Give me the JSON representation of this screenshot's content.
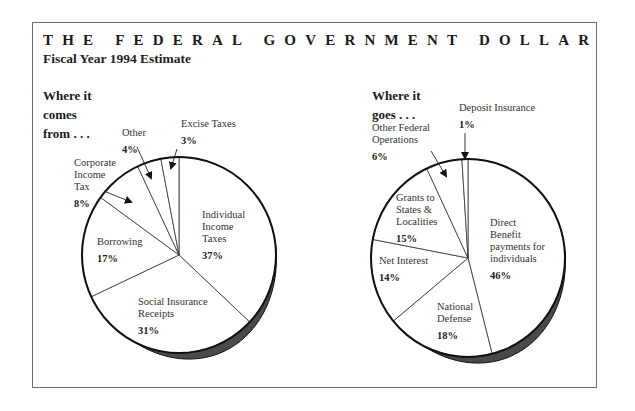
{
  "header": {
    "title": "THE FEDERAL GOVERNMENT DOLLAR",
    "subtitle": "Fiscal Year 1994 Estimate"
  },
  "chart_data": [
    {
      "type": "pie",
      "title": "Where it comes from . . .",
      "title_lines": [
        "Where it",
        "comes",
        "from . . ."
      ],
      "start": "top",
      "direction": "clockwise",
      "slices": [
        {
          "label": "Individual Income Taxes",
          "label_lines": [
            "Individual",
            "Income",
            "Taxes"
          ],
          "value": 37,
          "pct_text": "37%"
        },
        {
          "label": "Social Insurance Receipts",
          "label_lines": [
            "Social Insurance",
            "Receipts"
          ],
          "value": 31,
          "pct_text": "31%"
        },
        {
          "label": "Borrowing",
          "label_lines": [
            "Borrowing"
          ],
          "value": 17,
          "pct_text": "17%"
        },
        {
          "label": "Corporate Income Tax",
          "label_lines": [
            "Corporate",
            "Income",
            "Tax"
          ],
          "value": 8,
          "pct_text": "8%",
          "callout": true
        },
        {
          "label": "Other",
          "label_lines": [
            "Other"
          ],
          "value": 4,
          "pct_text": "4%",
          "callout": true
        },
        {
          "label": "Excise Taxes",
          "label_lines": [
            "Excise Taxes"
          ],
          "value": 3,
          "pct_text": "3%",
          "callout": true
        }
      ]
    },
    {
      "type": "pie",
      "title": "Where it goes . . .",
      "title_lines": [
        "Where it",
        "goes . . ."
      ],
      "start": "top",
      "direction": "clockwise",
      "slices": [
        {
          "label": "Direct Benefit payments for individuals",
          "label_lines": [
            "Direct",
            "Benefit",
            "payments for",
            "individuals"
          ],
          "value": 46,
          "pct_text": "46%"
        },
        {
          "label": "National Defense",
          "label_lines": [
            "National",
            "Defense"
          ],
          "value": 18,
          "pct_text": "18%"
        },
        {
          "label": "Net Interest",
          "label_lines": [
            "Net Interest"
          ],
          "value": 14,
          "pct_text": "14%"
        },
        {
          "label": "Grants to States & Localities",
          "label_lines": [
            "Grants to",
            "States &",
            "Localities"
          ],
          "value": 15,
          "pct_text": "15%"
        },
        {
          "label": "Other Federal Operations",
          "label_lines": [
            "Other Federal",
            "Operations"
          ],
          "value": 6,
          "pct_text": "6%",
          "callout": true
        },
        {
          "label": "Deposit Insurance",
          "label_lines": [
            "Deposit Insurance"
          ],
          "value": 1,
          "pct_text": "1%",
          "callout": true
        }
      ]
    }
  ]
}
